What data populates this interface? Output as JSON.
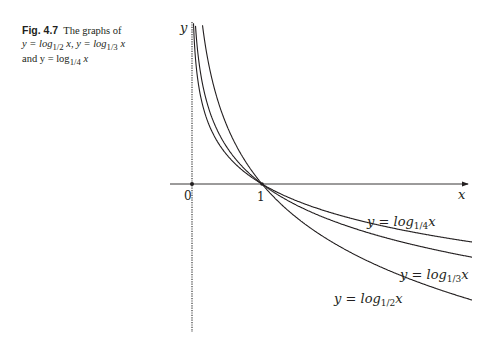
{
  "caption": {
    "label": "Fig. 4.7",
    "text_line1": "The graphs of",
    "text_line2_prefix": "y = log",
    "text_line2_sub1": "1/2",
    "text_line2_mid": " x, y = log",
    "text_line2_sub2": "1/3",
    "text_line2_suffix": " x",
    "text_line3_prefix": "and y = log",
    "text_line3_sub": "1/4",
    "text_line3_suffix": " x"
  },
  "chart_data": {
    "type": "line",
    "figure_label": "Fig. 4.7",
    "xlabel": "x",
    "ylabel": "y",
    "x_ticks": [
      {
        "value": 0,
        "label": "0"
      },
      {
        "value": 1,
        "label": "1"
      }
    ],
    "xlim": [
      -0.3,
      4.0
    ],
    "ylim": [
      -2.5,
      2.8
    ],
    "grid": false,
    "legend": "inline labels",
    "series": [
      {
        "name": "y = log_{1/4} x",
        "label_main": "y = log",
        "label_sub": "1/4",
        "label_tail": "x",
        "base": 0.25,
        "x": [
          0.02,
          0.05,
          0.1,
          0.25,
          0.5,
          1,
          1.5,
          2,
          2.5,
          3,
          3.5,
          4
        ],
        "y": [
          2.82,
          2.16,
          1.66,
          1.0,
          0.5,
          0,
          -0.29,
          -0.5,
          -0.66,
          -0.79,
          -0.9,
          -1.0
        ]
      },
      {
        "name": "y = log_{1/3} x",
        "label_main": "y = log",
        "label_sub": "1/3",
        "label_tail": "x",
        "base": 0.3333,
        "x": [
          0.046,
          0.1,
          0.25,
          0.5,
          1,
          1.5,
          2,
          2.5,
          3,
          3.5,
          4
        ],
        "y": [
          2.8,
          2.1,
          1.26,
          0.63,
          0,
          -0.37,
          -0.63,
          -0.83,
          -1.0,
          -1.14,
          -1.26
        ]
      },
      {
        "name": "y = log_{1/2} x",
        "label_main": "y = log",
        "label_sub": "1/2",
        "label_tail": "x",
        "base": 0.5,
        "x": [
          0.144,
          0.25,
          0.5,
          1,
          1.5,
          2,
          2.5,
          3,
          3.5,
          4
        ],
        "y": [
          2.8,
          2.0,
          1.0,
          0,
          -0.58,
          -1.0,
          -1.32,
          -1.58,
          -1.81,
          -2.0
        ]
      }
    ],
    "annotations": [
      "All three curves pass through (1, 0)",
      "y-axis drawn as dotted asymptote"
    ]
  },
  "colors": {
    "ink": "#231f20",
    "axis_dotted": "#555555",
    "background": "#ffffff"
  }
}
